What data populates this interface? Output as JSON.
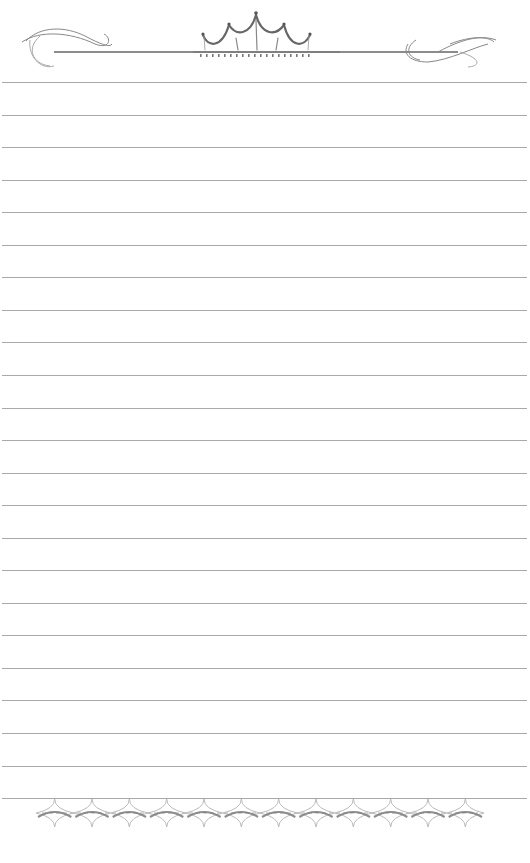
{
  "page": {
    "type": "lined-stationery",
    "background": "#ffffff",
    "rule_color": "#9a9a9a",
    "rule_count": 23,
    "first_rule_y": 82,
    "rule_spacing": 32.55,
    "rule_left": 2,
    "rule_width": 525
  },
  "header": {
    "ornament": "crown-flourish-icon",
    "flourish_left": "left-scroll-flourish-icon",
    "flourish_right": "right-scroll-flourish-icon",
    "crown_peaks": 5,
    "ornament_color": "#6e6e6e"
  },
  "footer": {
    "ornament": "diamond-chain-icon",
    "diamond_count": 12,
    "ornament_color": "#7a7a7a"
  }
}
